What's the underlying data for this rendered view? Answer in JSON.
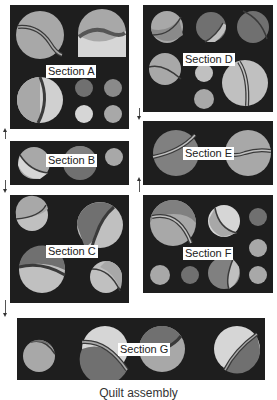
{
  "diagram": {
    "caption": "Quilt assembly",
    "colors": {
      "background": "#1e1e1e",
      "light": "#d6d6d6",
      "mid": "#a8a8a8",
      "dark": "#707070",
      "line": "#3a3a3a"
    },
    "sections": [
      {
        "id": "A",
        "label": "Section A"
      },
      {
        "id": "B",
        "label": "Section B"
      },
      {
        "id": "C",
        "label": "Section C"
      },
      {
        "id": "D",
        "label": "Section D"
      },
      {
        "id": "E",
        "label": "Section E"
      },
      {
        "id": "F",
        "label": "Section F"
      },
      {
        "id": "G",
        "label": "Section G"
      }
    ]
  }
}
